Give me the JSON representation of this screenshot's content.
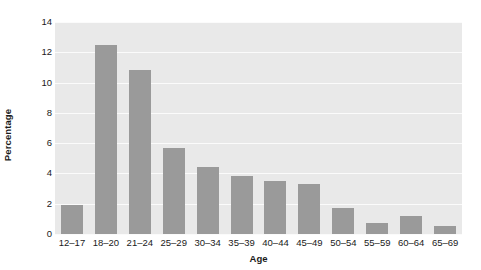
{
  "chart_data": {
    "type": "bar",
    "title": "",
    "xlabel": "Age",
    "ylabel": "Percentage",
    "categories": [
      "12–17",
      "18–20",
      "21–24",
      "25–29",
      "30–34",
      "35–39",
      "40–44",
      "45–49",
      "50–54",
      "55–59",
      "60–64",
      "65–69"
    ],
    "values": [
      1.9,
      12.5,
      10.8,
      5.7,
      4.4,
      3.8,
      3.5,
      3.3,
      1.7,
      0.7,
      1.2,
      0.5
    ],
    "ylim": [
      0,
      14
    ],
    "yticks": [
      0,
      2,
      4,
      6,
      8,
      10,
      12,
      14
    ],
    "ytick_labels": [
      "0",
      "2",
      "4",
      "6",
      "8",
      "10",
      "12",
      "14"
    ],
    "grid": true,
    "legend": false,
    "bar_color": "#9a9a9a",
    "plot_background": "#e9e9e9",
    "gridline_color": "#fbfbfb"
  }
}
